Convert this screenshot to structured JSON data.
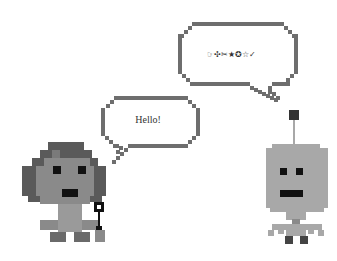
{
  "scene": {
    "width": 337,
    "height": 261,
    "background": "#ffffff"
  },
  "bubbles": {
    "left": {
      "text": "Hello!",
      "speaker": "girl-character"
    },
    "right": {
      "text": "☞✣✂★✪☆✓",
      "speaker": "robot-character"
    }
  },
  "characters": {
    "girl": {
      "name": "girl-character",
      "colors": {
        "hair": "#5a5a5a",
        "skin": "#8a8a8a",
        "clothes": "#9a9a9a",
        "shoes": "#6a6a6a",
        "eyes": "#111111"
      },
      "holding": "microphone"
    },
    "robot": {
      "name": "robot-character",
      "colors": {
        "body": "#a8a8a8",
        "antenna_tip": "#333333",
        "eyes": "#111111",
        "feet": "#444444"
      }
    }
  },
  "colors": {
    "bubble_border": "#6e6e6e",
    "text": "#333333"
  }
}
